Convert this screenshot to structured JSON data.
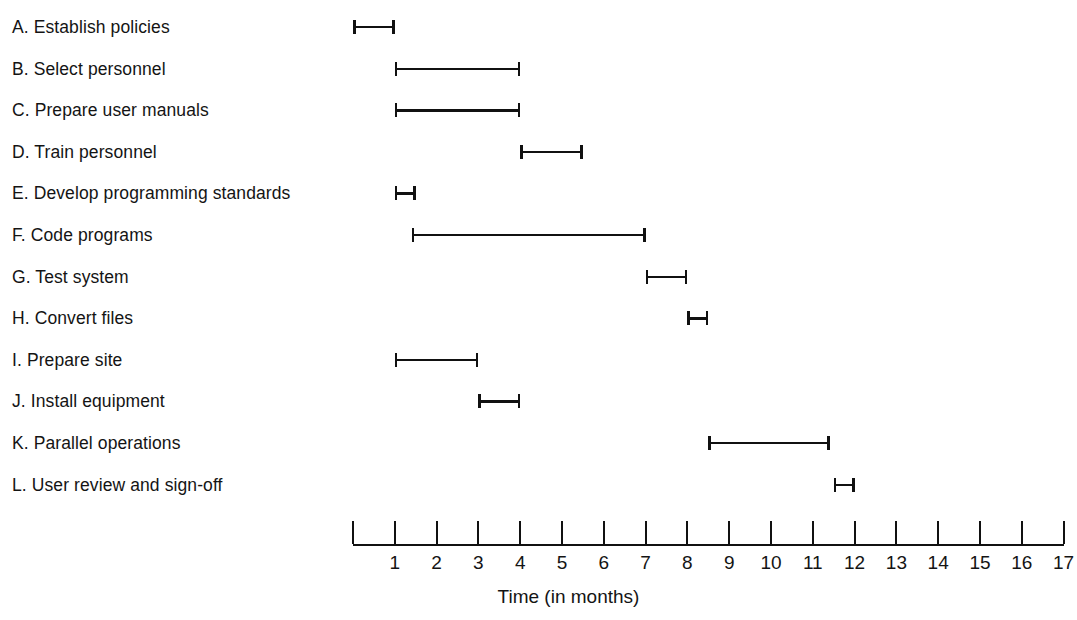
{
  "chart_data": {
    "type": "bar",
    "chart_style": "gantt",
    "title": "",
    "xlabel": "Time (in months)",
    "ylabel": "",
    "xlim": [
      0,
      17
    ],
    "grid": false,
    "legend": null,
    "x_tick_labels": [
      "1",
      "2",
      "3",
      "4",
      "5",
      "6",
      "7",
      "8",
      "9",
      "10",
      "11",
      "12",
      "13",
      "14",
      "15",
      "16",
      "17"
    ],
    "x_tick_values": [
      1,
      2,
      3,
      4,
      5,
      6,
      7,
      8,
      9,
      10,
      11,
      12,
      13,
      14,
      15,
      16,
      17
    ],
    "categories": [
      "A. Establish policies",
      "B. Select personnel",
      "C. Prepare user manuals",
      "D. Train personnel",
      "E. Develop programming standards",
      "F. Code programs",
      "G. Test system",
      "H. Convert files",
      "I. Prepare site",
      "J. Install equipment",
      "K. Parallel operations",
      "L. User review and sign-off"
    ],
    "tasks": [
      {
        "id": "A",
        "label": "A. Establish policies",
        "start": 0,
        "end": 1,
        "duration": 1
      },
      {
        "id": "B",
        "label": "B. Select personnel",
        "start": 1,
        "end": 4,
        "duration": 3
      },
      {
        "id": "C",
        "label": "C. Prepare user manuals",
        "start": 1,
        "end": 4,
        "duration": 3
      },
      {
        "id": "D",
        "label": "D. Train personnel",
        "start": 4,
        "end": 5.5,
        "duration": 1.5
      },
      {
        "id": "E",
        "label": "E. Develop programming standards",
        "start": 1,
        "end": 1.5,
        "duration": 0.5
      },
      {
        "id": "F",
        "label": "F. Code programs",
        "start": 1.4,
        "end": 7,
        "duration": 5.6
      },
      {
        "id": "G",
        "label": "G. Test system",
        "start": 7,
        "end": 8,
        "duration": 1
      },
      {
        "id": "H",
        "label": "H. Convert files",
        "start": 8,
        "end": 8.5,
        "duration": 0.5
      },
      {
        "id": "I",
        "label": "I. Prepare site",
        "start": 1,
        "end": 3,
        "duration": 2
      },
      {
        "id": "J",
        "label": "J. Install equipment",
        "start": 3,
        "end": 4,
        "duration": 1
      },
      {
        "id": "K",
        "label": "K. Parallel operations",
        "start": 8.5,
        "end": 11.4,
        "duration": 2.9
      },
      {
        "id": "L",
        "label": "L. User review and sign-off",
        "start": 11.5,
        "end": 12,
        "duration": 0.5
      }
    ]
  },
  "style": {
    "bar_color": "#111111",
    "axis_color": "#111111",
    "text_color": "#141414",
    "background": "#ffffff"
  }
}
